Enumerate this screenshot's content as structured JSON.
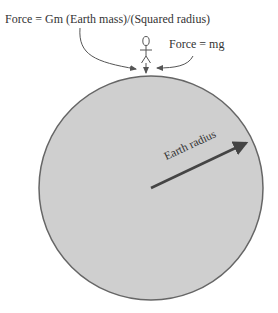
{
  "diagram": {
    "labels": {
      "gravity_formula": "Force = Gm (Earth mass)/(Squared radius)",
      "weight_formula": "Force = mg",
      "radius": "Earth radius"
    },
    "colors": {
      "earth_fill": "#cfcfcf",
      "earth_stroke": "#666666",
      "arrow": "#555555",
      "text": "#333333"
    },
    "elements": [
      "earth-circle",
      "stick-figure",
      "radius-arrow",
      "downward-force-arrow",
      "label-pointer-arrows"
    ]
  }
}
